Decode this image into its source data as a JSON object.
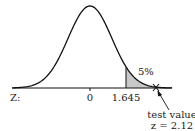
{
  "chart_data": {
    "type": "area",
    "title": "",
    "xlabel": "Z:",
    "ylabel": "",
    "x_ticks": [
      {
        "value": 0,
        "label": "0"
      },
      {
        "value": 1.645,
        "label": "1.645"
      }
    ],
    "shaded_region": {
      "from": 1.645,
      "to": "inf",
      "label": "5%",
      "color": "#c8c8c8"
    },
    "test_value": {
      "z": 2.12,
      "label_line1": "test value",
      "label_line2": "z = 2.12",
      "marker": "x"
    },
    "curve": "standard-normal-pdf",
    "xlim": [
      -3.3,
      3.3
    ],
    "grid": false
  },
  "labels": {
    "axis": "Z:",
    "zero": "0",
    "critical": "1.645",
    "area": "5%",
    "test1": "test value",
    "test2": "z = 2.12"
  }
}
